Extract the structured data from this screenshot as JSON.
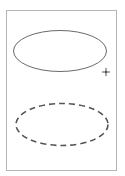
{
  "canvas": {
    "width": 125,
    "height": 176,
    "background": "#ffffff"
  },
  "frame": {
    "x": 6.5,
    "y": 10.5,
    "width": 110,
    "height": 160,
    "stroke": "#b5b5b5",
    "stroke_width": 1
  },
  "shapes": [
    {
      "type": "ellipse",
      "style": "solid",
      "cx": 60,
      "cy": 51,
      "rx": 46.5,
      "ry": 20.5,
      "stroke": "#6a6a6a",
      "stroke_width": 1
    },
    {
      "type": "ellipse",
      "style": "dashed",
      "cx": 62,
      "cy": 124.5,
      "rx": 46,
      "ry": 21,
      "stroke": "#555555",
      "stroke_width": 1.6,
      "dash": "6 4"
    }
  ],
  "marker": {
    "type": "crosshair",
    "icon": "crosshair-icon",
    "cx": 106,
    "cy": 72,
    "size": 4,
    "stroke": "#555555"
  }
}
